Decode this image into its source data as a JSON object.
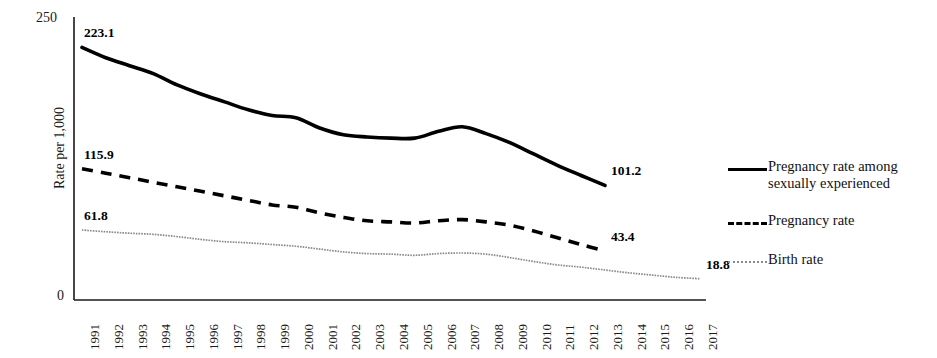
{
  "chart_data": {
    "type": "line",
    "title": "",
    "xlabel": "",
    "ylabel": "Rate per 1,000",
    "ylim": [
      0,
      250
    ],
    "y_ticks": [
      "0",
      "250"
    ],
    "grid": false,
    "legend_position": "right",
    "x": [
      1991,
      1992,
      1993,
      1994,
      1995,
      1996,
      1997,
      1998,
      1999,
      2000,
      2001,
      2002,
      2003,
      2004,
      2005,
      2006,
      2007,
      2008,
      2009,
      2010,
      2011,
      2012,
      2013,
      2014,
      2015,
      2016,
      2017
    ],
    "categories": [
      "1991",
      "1992",
      "1993",
      "1994",
      "1995",
      "1996",
      "1997",
      "1998",
      "1999",
      "2000",
      "2001",
      "2002",
      "2003",
      "2004",
      "2005",
      "2006",
      "2007",
      "2008",
      "2009",
      "2010",
      "2011",
      "2012",
      "2013",
      "2014",
      "2015",
      "2016",
      "2017"
    ],
    "series": [
      {
        "name": "Pregnancy rate among sexually experienced",
        "style": "solid",
        "color": "#000000",
        "x": [
          1991,
          1992,
          1993,
          1994,
          1995,
          1996,
          1997,
          1998,
          1999,
          2000,
          2001,
          2002,
          2003,
          2004,
          2005,
          2006,
          2007,
          2008,
          2009,
          2010,
          2011,
          2012,
          2013
        ],
        "values": [
          223.1,
          214.0,
          207.0,
          200.0,
          190.0,
          182.0,
          175.0,
          168.0,
          163.0,
          161.0,
          152.0,
          146.0,
          144.0,
          143.0,
          143.0,
          149.0,
          153.0,
          147.0,
          139.0,
          129.0,
          119.0,
          110.0,
          101.2
        ],
        "start_label": "223.1",
        "end_label": "101.2"
      },
      {
        "name": "Pregnancy rate",
        "style": "dashed",
        "color": "#000000",
        "x": [
          1991,
          1992,
          1993,
          1994,
          1995,
          1996,
          1997,
          1998,
          1999,
          2000,
          2001,
          2002,
          2003,
          2004,
          2005,
          2006,
          2007,
          2008,
          2009,
          2010,
          2011,
          2012,
          2013
        ],
        "values": [
          115.9,
          112.0,
          108.0,
          104.0,
          100.0,
          96.0,
          92.0,
          88.0,
          84.0,
          82.0,
          77.0,
          73.0,
          70.0,
          69.0,
          68.0,
          70.0,
          71.0,
          69.0,
          66.0,
          61.0,
          55.0,
          49.0,
          43.4
        ],
        "start_label": "115.9",
        "end_label": "43.4"
      },
      {
        "name": "Birth rate",
        "style": "thin",
        "color": "#8a8a8a",
        "x": [
          1991,
          1992,
          1993,
          1994,
          1995,
          1996,
          1997,
          1998,
          1999,
          2000,
          2001,
          2002,
          2003,
          2004,
          2005,
          2006,
          2007,
          2008,
          2009,
          2010,
          2011,
          2012,
          2013,
          2014,
          2015,
          2016,
          2017
        ],
        "values": [
          61.8,
          60.3,
          59.0,
          58.0,
          56.0,
          53.5,
          51.5,
          50.5,
          49.0,
          47.5,
          45.0,
          42.5,
          41.0,
          40.5,
          39.5,
          41.0,
          41.5,
          40.5,
          37.5,
          34.0,
          31.0,
          29.0,
          26.5,
          24.0,
          22.0,
          20.0,
          18.8
        ],
        "start_label": "61.8",
        "end_label": "18.8"
      }
    ],
    "annotations": [
      {
        "text": "223.1",
        "series": "Pregnancy rate among sexually experienced",
        "anchor": "start"
      },
      {
        "text": "101.2",
        "series": "Pregnancy rate among sexually experienced",
        "anchor": "end"
      },
      {
        "text": "115.9",
        "series": "Pregnancy rate",
        "anchor": "start"
      },
      {
        "text": "43.4",
        "series": "Pregnancy rate",
        "anchor": "end"
      },
      {
        "text": "61.8",
        "series": "Birth rate",
        "anchor": "start"
      },
      {
        "text": "18.8",
        "series": "Birth rate",
        "anchor": "end"
      }
    ]
  },
  "legend": {
    "items": [
      {
        "label": "Pregnancy rate among sexually experienced",
        "style": "solid"
      },
      {
        "label": "Pregnancy rate",
        "style": "dashed"
      },
      {
        "label": "Birth rate",
        "style": "thin"
      }
    ]
  },
  "axes": {
    "y_top_label": "250",
    "y_bottom_label": "0",
    "y_title": "Rate per 1,000"
  }
}
